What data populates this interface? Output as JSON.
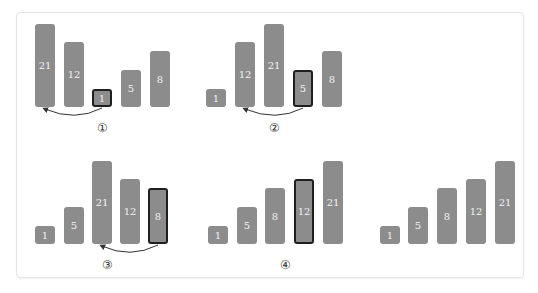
{
  "colors": {
    "bar": "#8c8c8c",
    "highlight_border": "#1f1f1f",
    "bar_text": "#f2f2f2"
  },
  "groups": [
    {
      "step": "①",
      "values": [
        "21",
        "12",
        "1",
        "5",
        "8"
      ],
      "highlight_index": 2
    },
    {
      "step": "②",
      "values": [
        "1",
        "12",
        "21",
        "5",
        "8"
      ],
      "highlight_index": 3
    },
    {
      "step": "③",
      "values": [
        "1",
        "5",
        "21",
        "12",
        "8"
      ],
      "highlight_index": 4
    },
    {
      "step": "④",
      "values": [
        "1",
        "5",
        "8",
        "12",
        "21"
      ],
      "highlight_index": 3
    },
    {
      "step": "",
      "values": [
        "1",
        "5",
        "8",
        "12",
        "21"
      ],
      "highlight_index": -1
    }
  ]
}
